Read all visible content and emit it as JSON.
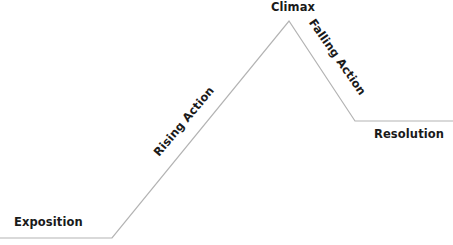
{
  "diagram": {
    "line_color": "#b3b3b3",
    "text_color": "#1a1a1a",
    "points": [
      {
        "x": 0,
        "y": 238
      },
      {
        "x": 112,
        "y": 238
      },
      {
        "x": 289,
        "y": 21
      },
      {
        "x": 355,
        "y": 121
      },
      {
        "x": 453,
        "y": 121
      }
    ],
    "stages": {
      "exposition": "Exposition",
      "rising_action": "Rising Action",
      "climax": "Climax",
      "falling_action": "Falling Action",
      "resolution": "Resolution"
    }
  }
}
